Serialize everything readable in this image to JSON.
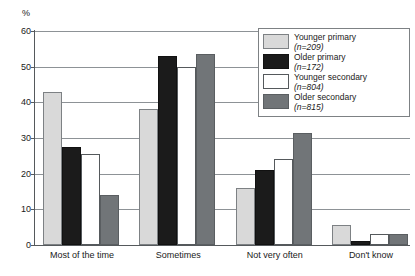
{
  "chart_data": {
    "type": "bar",
    "title": "",
    "subtitle": "",
    "xlabel": "",
    "ylabel": "%",
    "ylim": [
      0,
      60
    ],
    "yticks": [
      0,
      10,
      20,
      30,
      40,
      50,
      60
    ],
    "ytick_labels": [
      "0",
      "10",
      "20",
      "30",
      "40",
      "50",
      "60"
    ],
    "grid": true,
    "legend_position": "top-right",
    "categories": [
      "Most of the time",
      "Sometimes",
      "Not very often",
      "Don't know"
    ],
    "series": [
      {
        "name": "Younger primary",
        "n_label": "(n=209)",
        "n": 209,
        "color": "#d9d9d9",
        "values": [
          43,
          38,
          16,
          5.5
        ]
      },
      {
        "name": "Older primary",
        "n_label": "(n=172)",
        "n": 172,
        "color": "#1b1b1b",
        "values": [
          27.5,
          53,
          21,
          1
        ]
      },
      {
        "name": "Younger secondary",
        "n_label": "(n=804)",
        "n": 804,
        "color": "#ffffff",
        "values": [
          25.5,
          50,
          24,
          3
        ]
      },
      {
        "name": "Older secondary",
        "n_label": "(n=815)",
        "n": 815,
        "color": "#717578",
        "values": [
          14,
          53.5,
          31.5,
          3
        ]
      }
    ]
  },
  "axis": {
    "unit_label": "%"
  },
  "legend": {
    "entries": [
      {
        "label": "Younger primary",
        "n_label": "(n=209)"
      },
      {
        "label": "Older primary",
        "n_label": "(n=172)"
      },
      {
        "label": "Younger secondary",
        "n_label": "(n=804)"
      },
      {
        "label": "Older secondary",
        "n_label": "(n=815)"
      }
    ]
  }
}
